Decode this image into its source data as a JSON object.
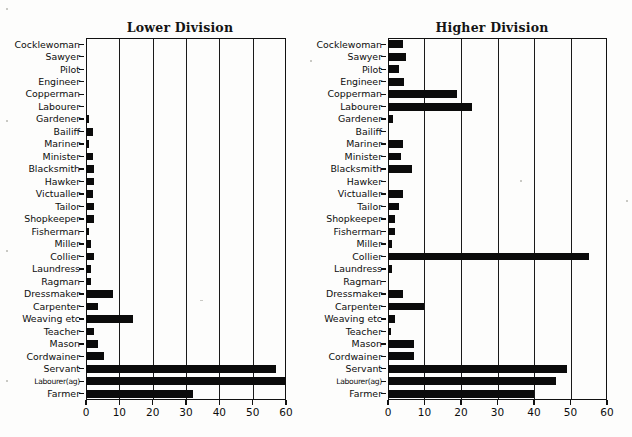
{
  "figure": {
    "width": 632,
    "height": 437,
    "background": "#fdfdfc",
    "bar_color": "#0b0b0b",
    "axis_color": "#111111"
  },
  "chart_data": [
    {
      "type": "bar",
      "orientation": "horizontal",
      "title": "Lower Division",
      "xlabel": "",
      "ylabel": "",
      "xlim": [
        0,
        60
      ],
      "xticks": [
        0,
        10,
        20,
        30,
        40,
        50,
        60
      ],
      "xticklabels": [
        "0",
        "10",
        "20",
        "30",
        "40",
        "50",
        "60"
      ],
      "grid": true,
      "legend": false,
      "categories": [
        "Cocklewoman",
        "Sawyer",
        "Pilot",
        "Engineer",
        "Copperman",
        "Labourer",
        "Gardener",
        "Bailiff",
        "Mariner",
        "Minister",
        "Blacksmith",
        "Hawker",
        "Victualler",
        "Tailor",
        "Shopkeeper",
        "Fisherman",
        "Miller",
        "Collier",
        "Laundress",
        "Ragman",
        "Dressmaker",
        "Carpenter",
        "Weaving etc",
        "Teacher",
        "Mason",
        "Cordwainer",
        "Servant",
        "Labourer(ag)",
        "Farmer"
      ],
      "values": [
        0,
        0,
        0,
        0,
        0,
        0,
        1,
        2,
        1,
        2,
        2.5,
        2.5,
        2,
        2.5,
        2.5,
        0.8,
        1.5,
        2.5,
        1.5,
        1.5,
        8,
        3.5,
        14,
        2.5,
        3.5,
        5.5,
        57,
        60,
        32
      ]
    },
    {
      "type": "bar",
      "orientation": "horizontal",
      "title": "Higher Division",
      "xlabel": "",
      "ylabel": "",
      "xlim": [
        0,
        60
      ],
      "xticks": [
        0,
        10,
        20,
        30,
        40,
        50,
        60
      ],
      "xticklabels": [
        "0",
        "10",
        "20",
        "30",
        "40",
        "50",
        "60"
      ],
      "grid": true,
      "legend": false,
      "categories": [
        "Cocklewoman",
        "Sawyer",
        "Pilot",
        "Engineer",
        "Copperman",
        "Labourer",
        "Gardener",
        "Bailiff",
        "Mariner",
        "Minister",
        "Blacksmith",
        "Hawker",
        "Victualler",
        "Tailor",
        "Shopkeeper",
        "Fisherman",
        "Miller",
        "Collier",
        "Laundress",
        "Ragman",
        "Dressmaker",
        "Carpenter",
        "Weaving etc",
        "Teacher",
        "Mason",
        "Cordwainer",
        "Servant",
        "Labourer(ag)",
        "Farmer"
      ],
      "values": [
        4,
        5,
        3,
        4.5,
        19,
        23,
        1.5,
        0,
        4,
        3.5,
        6.5,
        0,
        4,
        3,
        2,
        2,
        1,
        55,
        1,
        0,
        4,
        10,
        2,
        0.8,
        7,
        7,
        49,
        46,
        40
      ]
    }
  ]
}
